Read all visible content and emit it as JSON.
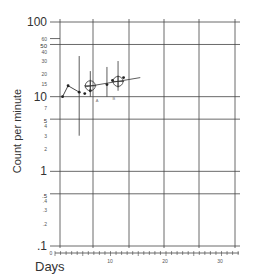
{
  "chart_data": {
    "type": "line",
    "title": "",
    "xlabel": "Days",
    "ylabel": "Count per minute",
    "yscale": "log",
    "ylim": [
      0.1,
      100
    ],
    "xlim": [
      0,
      33
    ],
    "grid": true,
    "y_major_ticks": [
      {
        "value": 100,
        "label": "100"
      },
      {
        "value": 50,
        "label": "50"
      },
      {
        "value": 10,
        "label": "10"
      },
      {
        "value": 5,
        "label": "5"
      },
      {
        "value": 1,
        "label": "1"
      },
      {
        "value": 0.5,
        "label": ".5"
      },
      {
        "value": 0.1,
        "label": ".1"
      }
    ],
    "y_minor_ticks": [
      {
        "value": 60,
        "label": "60"
      },
      {
        "value": 40,
        "label": "40"
      },
      {
        "value": 30,
        "label": "30"
      },
      {
        "value": 20,
        "label": "20"
      },
      {
        "value": 15,
        "label": "15"
      },
      {
        "value": 7,
        "label": "7"
      },
      {
        "value": 4,
        "label": "4"
      },
      {
        "value": 3,
        "label": "3"
      },
      {
        "value": 2,
        "label": "2"
      },
      {
        "value": 0.4,
        "label": ".4"
      },
      {
        "value": 0.3,
        "label": ".3"
      },
      {
        "value": 0.2,
        "label": ".2"
      }
    ],
    "x_ticks": [
      {
        "value": 0,
        "label": "0"
      },
      {
        "value": 10,
        "label": "10"
      },
      {
        "value": 20,
        "label": "20"
      },
      {
        "value": 30,
        "label": "30"
      }
    ],
    "series": [
      {
        "name": "observed",
        "x": [
          1,
          2,
          4,
          5,
          6,
          9,
          10,
          12
        ],
        "values": [
          10,
          14,
          11.5,
          11,
          12,
          14.5,
          16.5,
          18
        ]
      }
    ],
    "trend_line": {
      "x": [
        5,
        15
      ],
      "values": [
        13.5,
        18
      ]
    },
    "error_bars": [
      {
        "x": 4,
        "low": 3,
        "high": 35
      },
      {
        "x": 6,
        "low": 10,
        "high": 22
      },
      {
        "x": 9,
        "low": 10,
        "high": 25
      },
      {
        "x": 11,
        "low": 12,
        "high": 30
      }
    ],
    "circled_points": [
      {
        "x": 6,
        "y": 14
      },
      {
        "x": 11,
        "y": 16
      }
    ],
    "annotations": [
      {
        "text": "A",
        "x": 7,
        "y": 11
      },
      {
        "text": "B",
        "x": 10,
        "y": 11.5
      }
    ]
  }
}
